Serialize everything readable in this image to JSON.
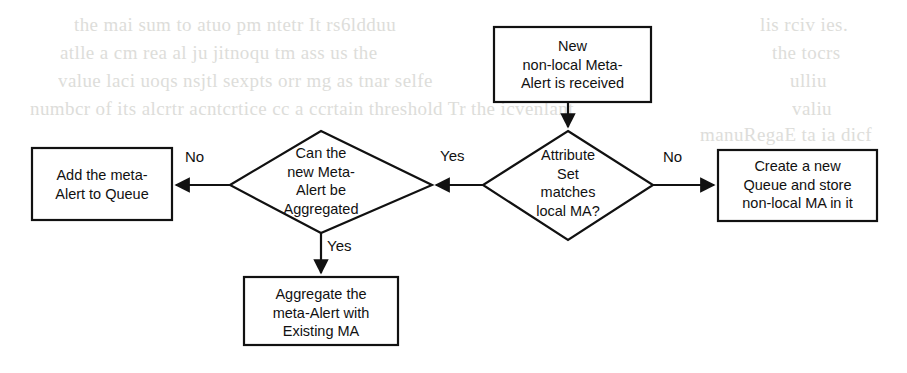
{
  "diagram": {
    "type": "flowchart",
    "background_color": "#ffffff",
    "stroke_color": "#111111",
    "nodes": [
      {
        "id": "new-meta-alert",
        "shape": "rectangle",
        "lines": [
          "New",
          "non-local Meta-",
          "Alert is received"
        ],
        "text": "New\nnon-local Meta-\nAlert is received"
      },
      {
        "id": "attribute-set-matches",
        "shape": "diamond",
        "lines": [
          "Attribute",
          "Set",
          "matches",
          "local MA?"
        ],
        "text": "Attribute\nSet\nmatches\nlocal MA?"
      },
      {
        "id": "can-be-aggregated",
        "shape": "diamond",
        "lines": [
          "Can the",
          "new Meta-",
          "Alert be",
          "Aggregated"
        ],
        "text": "Can the\nnew Meta-\nAlert be\nAggregated"
      },
      {
        "id": "add-to-queue",
        "shape": "rectangle",
        "lines": [
          "Add the meta-",
          "Alert to Queue"
        ],
        "text": "Add the meta-\nAlert to Queue"
      },
      {
        "id": "create-new-queue",
        "shape": "rectangle",
        "lines": [
          "Create a new",
          "Queue and store",
          "non-local MA in it"
        ],
        "text": "Create a new\nQueue and store\nnon-local MA in it"
      },
      {
        "id": "aggregate-with-existing",
        "shape": "rectangle",
        "lines": [
          "Aggregate the",
          "meta-Alert with",
          "Existing MA"
        ],
        "text": "Aggregate the\nmeta-Alert with\nExisting MA"
      }
    ],
    "edges": [
      {
        "id": "start-to-decision",
        "from": "new-meta-alert",
        "to": "attribute-set-matches",
        "label": ""
      },
      {
        "id": "matches-yes",
        "from": "attribute-set-matches",
        "to": "can-be-aggregated",
        "label": "Yes"
      },
      {
        "id": "matches-no",
        "from": "attribute-set-matches",
        "to": "create-new-queue",
        "label": "No"
      },
      {
        "id": "aggregated-no",
        "from": "can-be-aggregated",
        "to": "add-to-queue",
        "label": "No"
      },
      {
        "id": "aggregated-yes",
        "from": "can-be-aggregated",
        "to": "aggregate-with-existing",
        "label": "Yes"
      }
    ]
  },
  "background_text": {
    "note": "faint scanned show-through lines from the reverse page",
    "left_lines": [
      "the  mai    sum to   atuo pm   ntetr  It  rs6ldduu",
      "atlle    a  cm rea al ju   jitnoqu  tm   ass     us the",
      "value   laci uoqs  nsjtl   sexpts  orr  mg  as tnar  selfe",
      "numbcr of  its  alcrtr  acntcrtice  cc a ccrtain threshold  Tr  the  icvenlant"
    ],
    "right_lines": [
      "lis  rciv  ies.",
      "the  tocrs",
      "ulliu",
      "valiu",
      "manuRegaE  ta  ia  dicf"
    ]
  }
}
